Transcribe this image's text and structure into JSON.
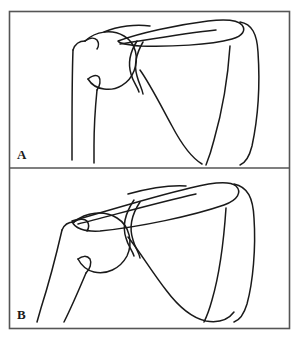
{
  "figure": {
    "background_color": "#ffffff",
    "stroke_color": "#1a1a1a",
    "frame": {
      "x": 9,
      "y": 11,
      "width": 281,
      "height": 318,
      "border_color": "#555555",
      "divider_y": 168
    },
    "panels": [
      {
        "id": "panel-a",
        "label": "A",
        "label_x": 17,
        "label_y": 148,
        "caption": "Normal resting shoulder: humeral head seated at glenoid, clavicle horizontal",
        "structures": [
          "humerus",
          "humeral-head",
          "glenoid",
          "acromion",
          "clavicle",
          "scapula-body",
          "scapular-spine"
        ]
      },
      {
        "id": "panel-b",
        "label": "B",
        "label_x": 17,
        "label_y": 308,
        "caption": "Elevated shoulder: humerus abducted, clavicle and scapula rotated upward",
        "structures": [
          "humerus",
          "humeral-head",
          "glenoid",
          "acromion",
          "clavicle",
          "scapula-body",
          "scapular-spine"
        ]
      }
    ]
  }
}
